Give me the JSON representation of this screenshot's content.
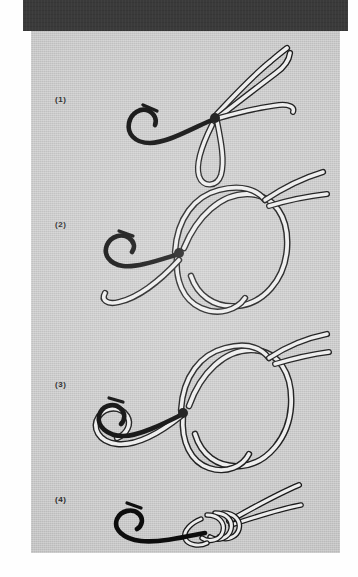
{
  "page": {
    "kind": "scanned-book-page",
    "background_color": "#c9c9c9",
    "scan_band_color": "#3a3a3a",
    "margin_color": "#fefefe",
    "line_color": "#e8e8e8",
    "line_outline_color": "#1a1a1a",
    "hook_color": "#0d0d0d"
  },
  "steps": [
    {
      "label": "(1)",
      "name": "step-1",
      "description": "Doubled line passed through the hook eye forming a loop"
    },
    {
      "label": "(2)",
      "name": "step-2",
      "description": "Loose overhand knot tied with the doubled line"
    },
    {
      "label": "(3)",
      "name": "step-3",
      "description": "Loop passed over the hook"
    },
    {
      "label": "(4)",
      "name": "step-4",
      "description": "Knot drawn tight against the hook eye"
    }
  ]
}
